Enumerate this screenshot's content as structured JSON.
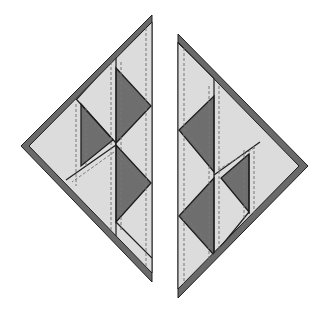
{
  "diagram": {
    "colors": {
      "background": "#ffffff",
      "light_fabric": "#dcdcdc",
      "dark_fabric": "#6e6e6e",
      "binding": "#6a6a6a",
      "outline": "#1e1e1e",
      "seam_line": "#7a7a7a"
    },
    "pieces": [
      {
        "id": "left-triangle",
        "outer": [
          [
            152,
            17
          ],
          [
            23,
            146
          ],
          [
            152,
            280
          ]
        ],
        "dark_triangles": [
          [
            [
              116,
              68
            ],
            [
              116,
              143
            ],
            [
              151,
              106
            ]
          ],
          [
            [
              116,
              145
            ],
            [
              116,
              222
            ],
            [
              151,
              183
            ]
          ],
          [
            [
              81,
              104
            ],
            [
              81,
              166
            ],
            [
              113,
              139
            ]
          ]
        ],
        "light_lines": [
          [
            [
              116,
              30
            ],
            [
              116,
              265
            ]
          ],
          [
            [
              80,
              100
            ],
            [
              80,
              166
            ]
          ],
          [
            [
              116,
              145
            ],
            [
              68,
              180
            ]
          ],
          [
            [
              152,
              30
            ],
            [
              152,
              268
            ]
          ]
        ]
      },
      {
        "id": "right-triangle",
        "outer": [
          [
            178,
            36
          ],
          [
            306,
            166
          ],
          [
            178,
            296
          ]
        ],
        "dark_triangles": [
          [
            [
              214,
              96
            ],
            [
              214,
              172
            ],
            [
              179,
              130
            ]
          ],
          [
            [
              214,
              178
            ],
            [
              214,
              255
            ],
            [
              179,
              216
            ]
          ],
          [
            [
              249,
              154
            ],
            [
              249,
              212
            ],
            [
              221,
              178
            ]
          ]
        ],
        "light_lines": [
          [
            [
              214,
              50
            ],
            [
              214,
              280
            ]
          ],
          [
            [
              250,
              150
            ],
            [
              250,
              214
            ]
          ],
          [
            [
              214,
              174
            ],
            [
              258,
              143
            ]
          ],
          [
            [
              178,
              50
            ],
            [
              178,
              283
            ]
          ]
        ]
      }
    ]
  }
}
